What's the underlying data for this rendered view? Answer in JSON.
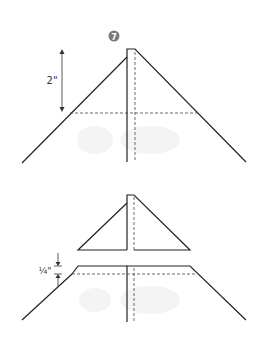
{
  "step": {
    "number": "7",
    "badge_color": "#7a7a7a"
  },
  "top_figure": {
    "measurement_label": "2\"",
    "description": "Square folded into a point with center seam; dashed fold line 2 inches below the tip"
  },
  "bottom_figure": {
    "measurement_label": "¼\"",
    "description": "Tip cut off and separated; quarter-inch gap marked above dashed line"
  },
  "colors": {
    "line": "#222222",
    "dashed": "#444444",
    "arrow": "#333333",
    "watermark": "#f2f2f2"
  }
}
